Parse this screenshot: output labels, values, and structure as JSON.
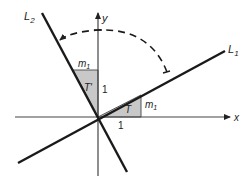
{
  "diagram": {
    "axes": {
      "x_label": "x",
      "y_label": "y"
    },
    "lines": [
      {
        "id": "L1",
        "label": "L",
        "subscript": "1"
      },
      {
        "id": "L2",
        "label": "L",
        "subscript": "2"
      }
    ],
    "triangles": [
      {
        "id": "T",
        "label": "T",
        "side_horizontal": "1",
        "side_vertical_label": "m",
        "side_vertical_sub": "1"
      },
      {
        "id": "T_prime",
        "label": "T'",
        "side_vertical": "1",
        "side_horizontal_label": "m",
        "side_horizontal_sub": "1"
      }
    ],
    "rotation_arrow": "dashed arc rotating L1 counterclockwise 90° onto L2",
    "colors": {
      "triangle_fill": "#c8c8c8",
      "line": "#1a1a1a",
      "axis": "#444444"
    }
  }
}
